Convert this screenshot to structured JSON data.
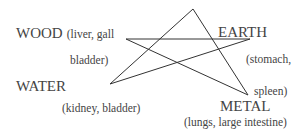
{
  "diagram": {
    "type": "five-element-star",
    "line_color": "#333333",
    "text_color": "#444444",
    "vertices": {
      "top": [
        193,
        9
      ],
      "wood": [
        126,
        39
      ],
      "earth": [
        250,
        39
      ],
      "water": [
        110,
        84
      ],
      "metal": [
        248,
        95
      ]
    },
    "edges": [
      [
        "top",
        "water"
      ],
      [
        "top",
        "metal"
      ],
      [
        "wood",
        "earth"
      ],
      [
        "wood",
        "metal"
      ],
      [
        "water",
        "earth"
      ]
    ]
  },
  "labels": {
    "wood": {
      "name": "WOOD",
      "organs_1": "(liver, gall",
      "organs_2": "bladder)"
    },
    "earth": {
      "name": "EARTH",
      "organs_1": "(stomach,",
      "organs_2": "spleen)"
    },
    "water": {
      "name": "WATER",
      "organs": "(kidney, bladder)"
    },
    "metal": {
      "name": "METAL",
      "organs": "(lungs, large intestine)"
    }
  }
}
